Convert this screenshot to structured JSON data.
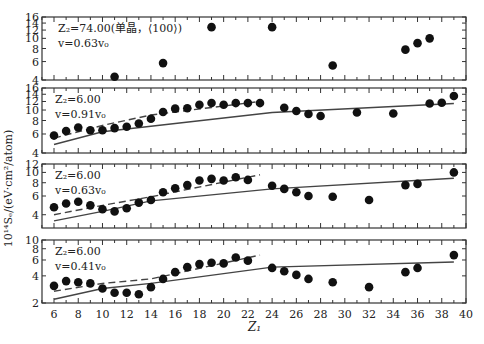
{
  "chart_data": {
    "type": "scatter",
    "xlabel": "Z1",
    "ylabel": "10^14 Se/(eV·cm²/atom)",
    "x_ticks": [
      6,
      8,
      10,
      12,
      14,
      16,
      18,
      20,
      22,
      24,
      26,
      28,
      30,
      32,
      34,
      36,
      38,
      40
    ],
    "xlim": [
      5,
      40
    ],
    "panels": [
      {
        "label_line1": "Z2=74.00(单晶，⟨100⟩)",
        "label_line2": "v=0.63v0",
        "yscale": "log",
        "ylim": [
          4,
          16
        ],
        "y_ticks": [
          4,
          6,
          8,
          10,
          12,
          14,
          16
        ],
        "points": [
          [
            11,
            4.3
          ],
          [
            15,
            5.8
          ],
          [
            19,
            12.8
          ],
          [
            24,
            12.8
          ],
          [
            29,
            5.5
          ],
          [
            35,
            7.8
          ],
          [
            36,
            9.0
          ],
          [
            37,
            10.0
          ]
        ],
        "solid_line": [],
        "dashed_line": []
      },
      {
        "label_line1": "Z2=6.00",
        "label_line2": "v=0.91v0",
        "yscale": "log",
        "ylim": [
          4,
          16
        ],
        "y_ticks": [
          4,
          6,
          8,
          10,
          12,
          14,
          16
        ],
        "points": [
          [
            6,
            5.8
          ],
          [
            7,
            6.4
          ],
          [
            8,
            6.9
          ],
          [
            9,
            6.5
          ],
          [
            10,
            6.5
          ],
          [
            11,
            6.8
          ],
          [
            12,
            7.0
          ],
          [
            13,
            7.5
          ],
          [
            14,
            8.3
          ],
          [
            15,
            9.6
          ],
          [
            16,
            10.3
          ],
          [
            17,
            10.4
          ],
          [
            18,
            11.2
          ],
          [
            19,
            11.6
          ],
          [
            20,
            11.2
          ],
          [
            21,
            11.6
          ],
          [
            22,
            11.6
          ],
          [
            23,
            11.6
          ],
          [
            25,
            10.5
          ],
          [
            26,
            9.8
          ],
          [
            27,
            9.2
          ],
          [
            28,
            8.8
          ],
          [
            31,
            9.5
          ],
          [
            34,
            9.3
          ],
          [
            37,
            11.5
          ],
          [
            38,
            11.7
          ],
          [
            39,
            13.5
          ]
        ],
        "solid_line": [
          [
            6,
            4.8
          ],
          [
            10,
            6.3
          ],
          [
            24,
            9.5
          ],
          [
            39,
            11.5
          ]
        ],
        "dashed_line": [
          [
            6,
            5.5
          ],
          [
            10,
            7.2
          ],
          [
            14,
            9.0
          ],
          [
            23,
            12.0
          ]
        ]
      },
      {
        "label_line1": "Z2=6.00",
        "label_line2": "v=0.63v0",
        "yscale": "log",
        "ylim": [
          3,
          12
        ],
        "y_ticks": [
          4,
          6,
          8,
          10,
          12
        ],
        "points": [
          [
            6,
            4.7
          ],
          [
            7,
            5.1
          ],
          [
            8,
            5.3
          ],
          [
            9,
            4.9
          ],
          [
            10,
            4.5
          ],
          [
            11,
            4.3
          ],
          [
            12,
            4.6
          ],
          [
            13,
            5.2
          ],
          [
            14,
            5.5
          ],
          [
            15,
            6.5
          ],
          [
            16,
            7.1
          ],
          [
            17,
            7.6
          ],
          [
            18,
            8.4
          ],
          [
            19,
            8.7
          ],
          [
            20,
            8.4
          ],
          [
            21,
            9.0
          ],
          [
            22,
            8.5
          ],
          [
            24,
            7.5
          ],
          [
            25,
            7.0
          ],
          [
            26,
            6.5
          ],
          [
            27,
            6.0
          ],
          [
            29,
            5.9
          ],
          [
            32,
            5.5
          ],
          [
            35,
            7.6
          ],
          [
            36,
            7.8
          ],
          [
            39,
            10.0
          ]
        ],
        "solid_line": [
          [
            6,
            3.5
          ],
          [
            10,
            4.3
          ],
          [
            14,
            5.4
          ],
          [
            24,
            7.0
          ],
          [
            39,
            8.8
          ]
        ],
        "dashed_line": [
          [
            6,
            4.0
          ],
          [
            10,
            4.9
          ],
          [
            14,
            5.9
          ],
          [
            23,
            9.5
          ]
        ]
      },
      {
        "label_line1": "Z2=6.00",
        "label_line2": "v=0.41v0",
        "yscale": "log",
        "ylim": [
          2,
          10
        ],
        "y_ticks": [
          2,
          4,
          6,
          8,
          10
        ],
        "points": [
          [
            6,
            3.1
          ],
          [
            7,
            3.5
          ],
          [
            8,
            3.4
          ],
          [
            9,
            3.3
          ],
          [
            10,
            2.9
          ],
          [
            11,
            2.6
          ],
          [
            12,
            2.6
          ],
          [
            13,
            2.5
          ],
          [
            14,
            3.0
          ],
          [
            15,
            3.7
          ],
          [
            16,
            4.4
          ],
          [
            17,
            5.0
          ],
          [
            18,
            5.4
          ],
          [
            19,
            5.6
          ],
          [
            20,
            5.5
          ],
          [
            21,
            6.4
          ],
          [
            22,
            5.9
          ],
          [
            24,
            4.9
          ],
          [
            25,
            4.5
          ],
          [
            26,
            4.1
          ],
          [
            27,
            3.7
          ],
          [
            29,
            3.4
          ],
          [
            32,
            3.0
          ],
          [
            35,
            4.4
          ],
          [
            36,
            4.9
          ],
          [
            39,
            6.8
          ]
        ],
        "solid_line": [
          [
            6,
            2.2
          ],
          [
            10,
            2.9
          ],
          [
            14,
            3.3
          ],
          [
            24,
            5.0
          ],
          [
            39,
            5.7
          ]
        ],
        "dashed_line": [
          [
            6,
            2.7
          ],
          [
            10,
            3.3
          ],
          [
            14,
            3.7
          ],
          [
            23,
            6.8
          ]
        ]
      }
    ]
  },
  "annotations": {
    "ylabel": "10¹⁴Sₑ/(eV·cm²/atom)",
    "xlabel": "Z₁",
    "panel_labels": [
      {
        "line1": "Z₂=74.00(单晶，⟨100⟩)",
        "line2": "v=0.63v₀"
      },
      {
        "line1": "Z₂=6.00",
        "line2": "v=0.91v₀"
      },
      {
        "line1": "Z₂=6.00",
        "line2": "v=0.63v₀"
      },
      {
        "line1": "Z₂=6.00",
        "line2": "v=0.41v₀"
      }
    ]
  }
}
